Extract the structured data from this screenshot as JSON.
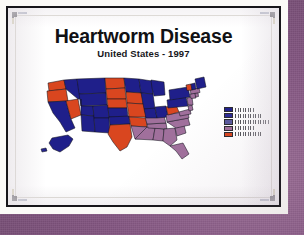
{
  "slide": {
    "title": "Heartworm Disease",
    "subtitle": "United States - 1997"
  },
  "colors": {
    "backdrop_purple": "#8d5f88",
    "paper_white": "#fbfaf7",
    "frame_dark": "#17161a",
    "state_navy": "#1f1f8a",
    "state_orange": "#d9461f",
    "state_mauve": "#a0709c",
    "state_outline": "#141420"
  },
  "map": {
    "type": "choropleth",
    "region": "United States",
    "title": "Heartworm Disease",
    "year": "1997",
    "categories": [
      {
        "id": "cat-1",
        "color": "#1f1f8a",
        "label": ""
      },
      {
        "id": "cat-2",
        "color": "#2b2b96",
        "label": ""
      },
      {
        "id": "cat-3",
        "color": "#5a5a9e",
        "label": ""
      },
      {
        "id": "cat-4",
        "color": "#a0709c",
        "label": ""
      },
      {
        "id": "cat-5",
        "color": "#d9461f",
        "label": ""
      }
    ],
    "states": [
      {
        "code": "WA",
        "fill": "#d9461f"
      },
      {
        "code": "OR",
        "fill": "#d9461f"
      },
      {
        "code": "CA",
        "fill": "#1f1f8a"
      },
      {
        "code": "NV",
        "fill": "#d9461f"
      },
      {
        "code": "ID",
        "fill": "#1f1f8a"
      },
      {
        "code": "MT",
        "fill": "#1f1f8a"
      },
      {
        "code": "WY",
        "fill": "#1f1f8a"
      },
      {
        "code": "UT",
        "fill": "#1f1f8a"
      },
      {
        "code": "AZ",
        "fill": "#1f1f8a"
      },
      {
        "code": "CO",
        "fill": "#1f1f8a"
      },
      {
        "code": "NM",
        "fill": "#1f1f8a"
      },
      {
        "code": "ND",
        "fill": "#d9461f"
      },
      {
        "code": "SD",
        "fill": "#d9461f"
      },
      {
        "code": "NE",
        "fill": "#d9461f"
      },
      {
        "code": "KS",
        "fill": "#1f1f8a"
      },
      {
        "code": "OK",
        "fill": "#1f1f8a"
      },
      {
        "code": "TX",
        "fill": "#d9461f"
      },
      {
        "code": "MN",
        "fill": "#1f1f8a"
      },
      {
        "code": "IA",
        "fill": "#d9461f"
      },
      {
        "code": "MO",
        "fill": "#d9461f"
      },
      {
        "code": "AR",
        "fill": "#d9461f"
      },
      {
        "code": "LA",
        "fill": "#a0709c"
      },
      {
        "code": "WI",
        "fill": "#1f1f8a"
      },
      {
        "code": "IL",
        "fill": "#1f1f8a"
      },
      {
        "code": "MS",
        "fill": "#a0709c"
      },
      {
        "code": "AL",
        "fill": "#a0709c"
      },
      {
        "code": "TN",
        "fill": "#a0709c"
      },
      {
        "code": "KY",
        "fill": "#a0709c"
      },
      {
        "code": "IN",
        "fill": "#1f1f8a"
      },
      {
        "code": "MI",
        "fill": "#1f1f8a"
      },
      {
        "code": "OH",
        "fill": "#1f1f8a"
      },
      {
        "code": "GA",
        "fill": "#a0709c"
      },
      {
        "code": "FL",
        "fill": "#a0709c"
      },
      {
        "code": "SC",
        "fill": "#a0709c"
      },
      {
        "code": "NC",
        "fill": "#a0709c"
      },
      {
        "code": "VA",
        "fill": "#a0709c"
      },
      {
        "code": "WV",
        "fill": "#d9461f"
      },
      {
        "code": "PA",
        "fill": "#1f1f8a"
      },
      {
        "code": "NY",
        "fill": "#1f1f8a"
      },
      {
        "code": "MD",
        "fill": "#a0709c"
      },
      {
        "code": "DE",
        "fill": "#a0709c"
      },
      {
        "code": "NJ",
        "fill": "#a0709c"
      },
      {
        "code": "CT",
        "fill": "#a0709c"
      },
      {
        "code": "RI",
        "fill": "#a0709c"
      },
      {
        "code": "MA",
        "fill": "#a0709c"
      },
      {
        "code": "VT",
        "fill": "#d9461f"
      },
      {
        "code": "NH",
        "fill": "#1f1f8a"
      },
      {
        "code": "ME",
        "fill": "#1f1f8a"
      },
      {
        "code": "AK",
        "fill": "#1f1f8a"
      },
      {
        "code": "HI",
        "fill": "#1f1f8a"
      }
    ]
  }
}
